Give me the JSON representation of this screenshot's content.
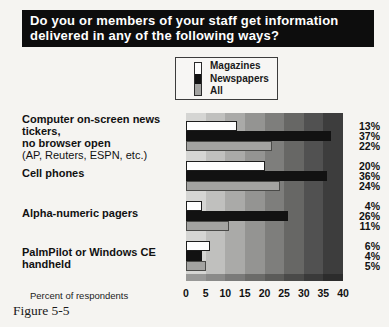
{
  "figure": {
    "title_line1": "Do you or members of your staff get information",
    "title_line2": "delivered in any of the following ways?",
    "caption": "Figure 5-5",
    "xlabel": "Percent of respondents"
  },
  "chart_data": {
    "type": "bar",
    "orientation": "horizontal",
    "title": "Do you or members of your staff get information delivered in any of the following ways?",
    "xlabel": "Percent of respondents",
    "xlim": [
      0,
      40
    ],
    "x_ticks": [
      0,
      5,
      10,
      15,
      20,
      25,
      30,
      35,
      40
    ],
    "grid": "off",
    "background": "stepped gray vertical bands, light at 0 to dark at 40",
    "legend_position": "top-center",
    "legend_entries": [
      "Magazines",
      "Newspapers",
      "All"
    ],
    "categories": [
      {
        "lines": [
          "Computer on-screen news tickers,",
          "no browser open"
        ],
        "note": "(AP, Reuters, ESPN, etc.)"
      },
      {
        "lines": [
          "Cell phones"
        ],
        "note": ""
      },
      {
        "lines": [
          "Alpha-numeric pagers"
        ],
        "note": ""
      },
      {
        "lines": [
          "PalmPilot or Windows CE",
          "handheld"
        ],
        "note": ""
      }
    ],
    "series": [
      {
        "name": "Magazines",
        "color": "#fdfdfd",
        "values": [
          13,
          20,
          4,
          6
        ]
      },
      {
        "name": "Newspapers",
        "color": "#121212",
        "values": [
          37,
          36,
          26,
          4
        ]
      },
      {
        "name": "All",
        "color": "#a3a3a1",
        "values": [
          22,
          24,
          11,
          5
        ]
      }
    ],
    "value_label_format": "{value}%",
    "band_colors": [
      "#d5d5d3",
      "#c0c0be",
      "#aaaaa8",
      "#949492",
      "#7e7e7c",
      "#676765",
      "#515151",
      "#3d3d3d"
    ]
  }
}
